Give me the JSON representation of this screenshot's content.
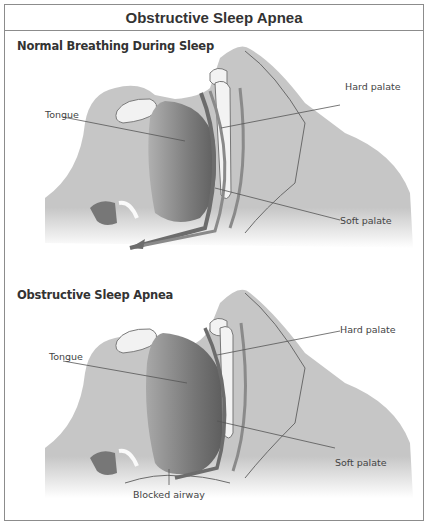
{
  "diagram": {
    "title": "Obstructive Sleep Apnea",
    "panels": [
      {
        "heading": "Normal Breathing During Sleep",
        "labels": {
          "tongue": "Tongue",
          "hard_palate": "Hard palate",
          "soft_palate": "Soft palate"
        },
        "airway_state": "open"
      },
      {
        "heading": "Obstructive Sleep Apnea",
        "labels": {
          "tongue": "Tongue",
          "hard_palate": "Hard palate",
          "soft_palate": "Soft palate",
          "blocked_airway": "Blocked airway"
        },
        "airway_state": "blocked"
      }
    ],
    "colors": {
      "tissue": "#c4c4c4",
      "tissue_dark": "#8a8a8a",
      "tongue": "#7a7a7a",
      "bone": "#f2f2f2",
      "outline": "#6a6a6a",
      "frame": "#8c8c8c"
    }
  }
}
